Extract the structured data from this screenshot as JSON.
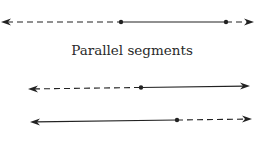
{
  "caption": "Parallel segments",
  "colors": {
    "stroke": "#222222",
    "background": "#ffffff"
  },
  "lines": [
    {
      "name": "top-line",
      "y_left": 22,
      "y_right": 22,
      "left_tip": 1,
      "right_tip": 254,
      "points": [
        121,
        226
      ],
      "styles": [
        "dashed",
        "solid",
        "dashed"
      ]
    },
    {
      "name": "middle-line",
      "y_left": 89,
      "y_right": 86,
      "left_tip": 28,
      "right_tip": 250,
      "points": [
        141
      ],
      "styles": [
        "dashed",
        "solid"
      ]
    },
    {
      "name": "bottom-line",
      "y_left": 122,
      "y_right": 119,
      "left_tip": 30,
      "right_tip": 252,
      "points": [
        177
      ],
      "styles": [
        "solid",
        "dashed"
      ]
    }
  ]
}
